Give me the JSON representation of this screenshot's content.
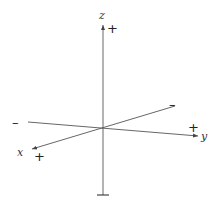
{
  "diagram": {
    "type": "3d-coordinate-axes",
    "axes": [
      {
        "name": "x",
        "label": "x",
        "positive_sign": "+",
        "negative_sign": "–",
        "from": [
          175,
          106
        ],
        "to": [
          32,
          149
        ]
      },
      {
        "name": "y",
        "label": "y",
        "positive_sign": "+",
        "negative_sign": "–",
        "from": [
          28,
          122
        ],
        "to": [
          198,
          136
        ]
      },
      {
        "name": "z",
        "label": "z",
        "positive_sign": "+",
        "negative_sign": "–",
        "from": [
          103,
          195
        ],
        "to": [
          103,
          25
        ]
      }
    ],
    "origin": [
      103,
      128
    ],
    "colors": {
      "axis": "#444444",
      "text": "#222222",
      "background": "#ffffff"
    }
  }
}
